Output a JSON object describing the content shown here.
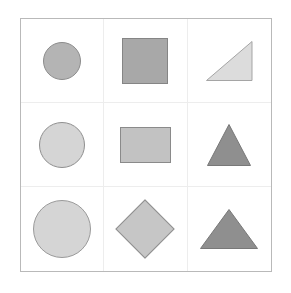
{
  "figure": {
    "type": "shape-grid",
    "rows": 3,
    "columns": 3,
    "background_color": "#ffffff",
    "outer_border_color": "#b9b9b9",
    "grid_line_color": "#ededed"
  },
  "cells": [
    {
      "row": 1,
      "column": 1,
      "shape": "circle",
      "size_label": "small",
      "width": 38,
      "height": 38,
      "fill": "#b4b4b4",
      "stroke": "#8c8c8c"
    },
    {
      "row": 1,
      "column": 2,
      "shape": "square",
      "size_label": "medium",
      "width": 46,
      "height": 46,
      "fill": "#a8a8a8",
      "stroke": "#858585"
    },
    {
      "row": 1,
      "column": 3,
      "shape": "right-triangle",
      "size_label": "medium",
      "width": 46,
      "height": 40,
      "fill": "#dcdcdc",
      "stroke": "#a5a5a5",
      "orientation": "right-angle-bottom-right"
    },
    {
      "row": 2,
      "column": 1,
      "shape": "circle",
      "size_label": "medium",
      "width": 46,
      "height": 46,
      "fill": "#d5d5d5",
      "stroke": "#8f8f8f"
    },
    {
      "row": 2,
      "column": 2,
      "shape": "rectangle",
      "size_label": "medium-wide",
      "width": 51,
      "height": 36,
      "fill": "#c2c2c2",
      "stroke": "#8a8a8a"
    },
    {
      "row": 2,
      "column": 3,
      "shape": "triangle",
      "size_label": "medium",
      "width": 44,
      "height": 42,
      "fill": "#8f8f8f",
      "stroke": "#787878",
      "orientation": "point-up"
    },
    {
      "row": 3,
      "column": 1,
      "shape": "circle",
      "size_label": "large",
      "width": 58,
      "height": 58,
      "fill": "#d5d5d5",
      "stroke": "#9a9a9a"
    },
    {
      "row": 3,
      "column": 2,
      "shape": "diamond",
      "size_label": "large",
      "width": 42,
      "height": 42,
      "fill": "#c6c6c6",
      "stroke": "#8f8f8f"
    },
    {
      "row": 3,
      "column": 3,
      "shape": "triangle",
      "size_label": "large-wide",
      "width": 58,
      "height": 40,
      "fill": "#8f8f8f",
      "stroke": "#787878",
      "orientation": "point-up"
    }
  ]
}
